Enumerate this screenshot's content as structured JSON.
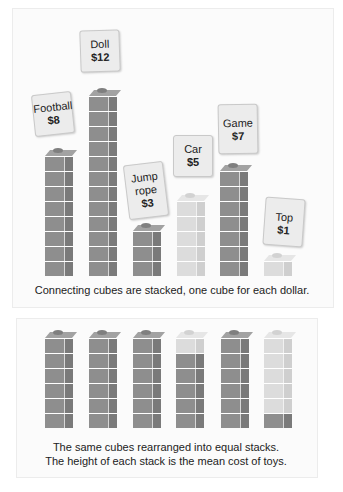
{
  "top_panel": {
    "caption": "Connecting cubes are stacked, one cube for each dollar.",
    "toys": [
      {
        "name": "Football",
        "price": "$8",
        "cubes": 8,
        "shade": "dark"
      },
      {
        "name": "Doll",
        "price": "$12",
        "cubes": 12,
        "shade": "dark"
      },
      {
        "name": "Jump rope",
        "price": "$3",
        "cubes": 3,
        "shade": "dark"
      },
      {
        "name": "Car",
        "price": "$5",
        "cubes": 5,
        "shade": "light"
      },
      {
        "name": "Game",
        "price": "$7",
        "cubes": 7,
        "shade": "dark"
      },
      {
        "name": "Top",
        "price": "$1",
        "cubes": 1,
        "shade": "light"
      }
    ]
  },
  "bottom_panel": {
    "caption_line1": "The same cubes rearranged into equal stacks.",
    "caption_line2": "The height of each stack is the mean cost of toys.",
    "stacks": [
      {
        "cubes_bottom_to_top": [
          "dark",
          "dark",
          "dark",
          "dark",
          "dark",
          "dark"
        ]
      },
      {
        "cubes_bottom_to_top": [
          "dark",
          "dark",
          "dark",
          "dark",
          "dark",
          "dark"
        ]
      },
      {
        "cubes_bottom_to_top": [
          "dark",
          "dark",
          "dark",
          "dark",
          "dark",
          "dark"
        ]
      },
      {
        "cubes_bottom_to_top": [
          "dark",
          "dark",
          "dark",
          "dark",
          "dark",
          "light"
        ]
      },
      {
        "cubes_bottom_to_top": [
          "dark",
          "dark",
          "dark",
          "dark",
          "dark",
          "dark"
        ]
      },
      {
        "cubes_bottom_to_top": [
          "dark",
          "light",
          "light",
          "light",
          "light",
          "light"
        ]
      }
    ],
    "mean": 6
  },
  "colors": {
    "dark_cube": "#8e8e8e",
    "light_cube": "#dcdcdc",
    "card_bg": "#ececec",
    "panel_bg": "#fbfbfb"
  }
}
